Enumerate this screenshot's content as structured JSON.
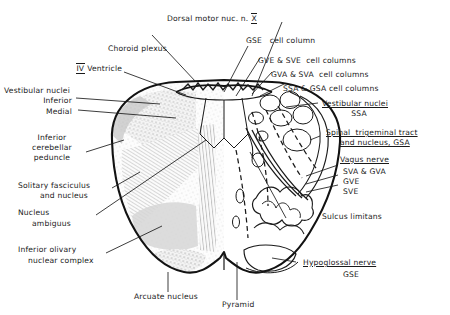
{
  "figure": {
    "background_color": "#ffffff",
    "ink_color": "#1a1a1a"
  },
  "labels": {
    "dorsal_motor": {
      "line1_pre": "Dorsal motor nuc. n. ",
      "roman": "X"
    },
    "choroid_plexus": "Choroid plexus",
    "fourth_ventricle": {
      "roman": "IV",
      "text": " Ventricle"
    },
    "vestibular_nuclei_left": "Vestibular nuclei",
    "inferior": "Inferior",
    "medial": "Medial",
    "inferior_cerebellar_peduncle": {
      "l1": "Inferior",
      "l2": "cerebellar",
      "l3": "peduncle"
    },
    "solitary": {
      "l1": "Solitary fasciculus",
      "l2": "and nucleus"
    },
    "nucleus_ambiguus": {
      "l1": "Nucleus",
      "l2": "ambiguus"
    },
    "inferior_olivary": {
      "l1": "Inferior olivary",
      "l2": "nuclear complex"
    },
    "arcuate_nucleus": "Arcuate nucleus",
    "pyramid": "Pyramid",
    "gse_cell_column": "GSE   cell column",
    "gve_sve_cell_columns": "GVE & SVE  cell columns",
    "gva_sva_cell_columns": "GVA & SVA  cell columns",
    "ssa_gsa_cell_columns": "SSA & GSA cell columns",
    "vestibular_nuclei_right": {
      "l1": "Vestibular nuclei",
      "l2": "SSA"
    },
    "spinal_trigeminal": {
      "l1": "Spinal  trigeminal tract",
      "l2": "and nucleus, GSA"
    },
    "vagus_nerve": {
      "title": "Vagus nerve",
      "components": [
        "SVA & GVA",
        "GVE",
        "SVE"
      ]
    },
    "sulcus_limitans": "Sulcus limitans",
    "hypoglossal_nerve": {
      "l1": "Hypoglossal nerve",
      "l2": "GSE"
    }
  }
}
